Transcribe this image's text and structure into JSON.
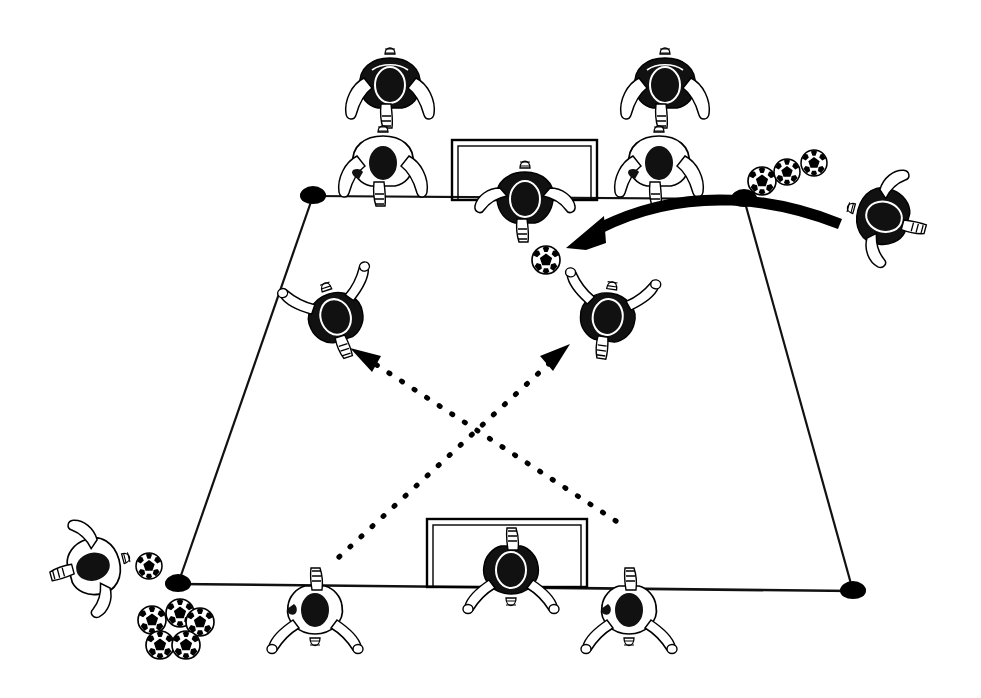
{
  "diagram": {
    "type": "soccer-drill-diagram",
    "title": "Soccer crossing and finishing drill",
    "style": "black-and-white line illustration, top-down / overhead view",
    "background_color": "#ffffff",
    "ink_color": "#000000"
  },
  "field": {
    "shape": "trapezoid",
    "description": "Grid/area marked by four cone markers joined by thin straight lines",
    "line_color": "#111111",
    "corners": [
      {
        "name": "top-left-cone",
        "x": 313,
        "y": 196
      },
      {
        "name": "top-right-cone",
        "x": 744,
        "y": 199
      },
      {
        "name": "bottom-right-cone",
        "x": 853,
        "y": 591
      },
      {
        "name": "bottom-left-cone",
        "x": 178,
        "y": 584
      }
    ],
    "top_line": {
      "from": [
        313,
        196
      ],
      "to": [
        744,
        199
      ]
    },
    "bottom_line": {
      "from": [
        178,
        584
      ],
      "to": [
        853,
        591
      ]
    },
    "left_line": {
      "from": [
        313,
        196
      ],
      "to": [
        178,
        584
      ]
    },
    "right_line": {
      "from": [
        744,
        199
      ],
      "to": [
        853,
        591
      ]
    }
  },
  "goals": [
    {
      "name": "top-goal",
      "x": 452,
      "y": 140,
      "width": 145,
      "height": 60,
      "orientation": "facing-down",
      "frame_color": "#000000"
    },
    {
      "name": "bottom-goal",
      "x": 427,
      "y": 519,
      "width": 160,
      "height": 68,
      "orientation": "facing-up",
      "frame_color": "#000000"
    }
  ],
  "cones": [
    {
      "name": "cone-top-left",
      "x": 313,
      "y": 196
    },
    {
      "name": "cone-top-right",
      "x": 744,
      "y": 199
    },
    {
      "name": "cone-bottom-left",
      "x": 178,
      "y": 584
    },
    {
      "name": "cone-bottom-right",
      "x": 853,
      "y": 591
    }
  ],
  "players": [
    {
      "id": "p1",
      "name": "player-top-row-left-dark",
      "x": 390,
      "y": 88,
      "kit": "dark",
      "pose": "arms-down",
      "rotation": 0
    },
    {
      "id": "p2",
      "name": "player-top-row-right-dark",
      "x": 665,
      "y": 88,
      "kit": "dark",
      "pose": "arms-down",
      "rotation": 0
    },
    {
      "id": "p3",
      "name": "player-goal-line-left-white",
      "x": 383,
      "y": 166,
      "kit": "white",
      "pose": "arms-down",
      "rotation": 0
    },
    {
      "id": "p4",
      "name": "player-goal-line-right-white",
      "x": 659,
      "y": 166,
      "kit": "white",
      "pose": "arms-down",
      "rotation": 0
    },
    {
      "id": "p5",
      "name": "goalkeeper-top-dark",
      "x": 525,
      "y": 200,
      "kit": "dark",
      "pose": "arms-out",
      "rotation": 0
    },
    {
      "id": "p6",
      "name": "server-right-dark",
      "x": 885,
      "y": 217,
      "kit": "dark",
      "pose": "arms-out",
      "rotation": -75
    },
    {
      "id": "p7",
      "name": "attacker-left-dark",
      "x": 335,
      "y": 315,
      "kit": "dark",
      "pose": "arms-up",
      "rotation": -18
    },
    {
      "id": "p8",
      "name": "attacker-right-dark",
      "x": 608,
      "y": 315,
      "kit": "dark",
      "pose": "arms-up",
      "rotation": 8
    },
    {
      "id": "p9",
      "name": "server-bottom-left-white",
      "x": 92,
      "y": 567,
      "kit": "white",
      "pose": "arms-out",
      "rotation": 75
    },
    {
      "id": "p10",
      "name": "player-bottom-left-white",
      "x": 315,
      "y": 612,
      "kit": "white",
      "pose": "arms-up",
      "rotation": 180
    },
    {
      "id": "p11",
      "name": "goalkeeper-bottom-dark",
      "x": 511,
      "y": 572,
      "kit": "dark",
      "pose": "arms-up",
      "rotation": 180
    },
    {
      "id": "p12",
      "name": "player-bottom-right-white",
      "x": 629,
      "y": 612,
      "kit": "white",
      "pose": "arms-up",
      "rotation": 180
    }
  ],
  "balls": [
    {
      "name": "ball-pass-target",
      "x": 546,
      "y": 260,
      "r": 14
    },
    {
      "name": "ball-supply-top-a",
      "x": 762,
      "y": 181,
      "r": 14
    },
    {
      "name": "ball-supply-top-b",
      "x": 787,
      "y": 172,
      "r": 13
    },
    {
      "name": "ball-supply-top-c",
      "x": 814,
      "y": 163,
      "r": 13
    },
    {
      "name": "ball-left-single",
      "x": 149,
      "y": 566,
      "r": 13
    },
    {
      "name": "ball-pile-1",
      "x": 152,
      "y": 620,
      "r": 14
    },
    {
      "name": "ball-pile-2",
      "x": 180,
      "y": 613,
      "r": 14
    },
    {
      "name": "ball-pile-3",
      "x": 200,
      "y": 622,
      "r": 14
    },
    {
      "name": "ball-pile-4",
      "x": 160,
      "y": 645,
      "r": 14
    },
    {
      "name": "ball-pile-5",
      "x": 186,
      "y": 645,
      "r": 14
    }
  ],
  "arrows": {
    "ball_path": {
      "name": "thick-curved-ball-path-arrow",
      "style": "thick solid curve with solid arrowhead",
      "description": "Cross / served ball travelling from the right-hand server toward the near post area",
      "from": [
        838,
        222
      ],
      "control": [
        690,
        185
      ],
      "to": [
        568,
        248
      ],
      "stroke_width": 9
    },
    "runs": [
      {
        "name": "dotted-run-arrow-to-left-attacker",
        "style": "dotted line with solid arrowhead",
        "description": "Diagonal run from bottom-right toward the left attacking position",
        "from": [
          616,
          521
        ],
        "to": [
          356,
          352
        ]
      },
      {
        "name": "dotted-run-arrow-to-right-attacker",
        "style": "dotted line with solid arrowhead",
        "description": "Diagonal run from bottom-left toward the right attacking position",
        "from": [
          339,
          557
        ],
        "to": [
          565,
          348
        ]
      }
    ]
  },
  "counts": {
    "players": 12,
    "balls": 10,
    "goals": 2,
    "cones": 4,
    "solid_arrows": 1,
    "dotted_arrows": 2
  }
}
